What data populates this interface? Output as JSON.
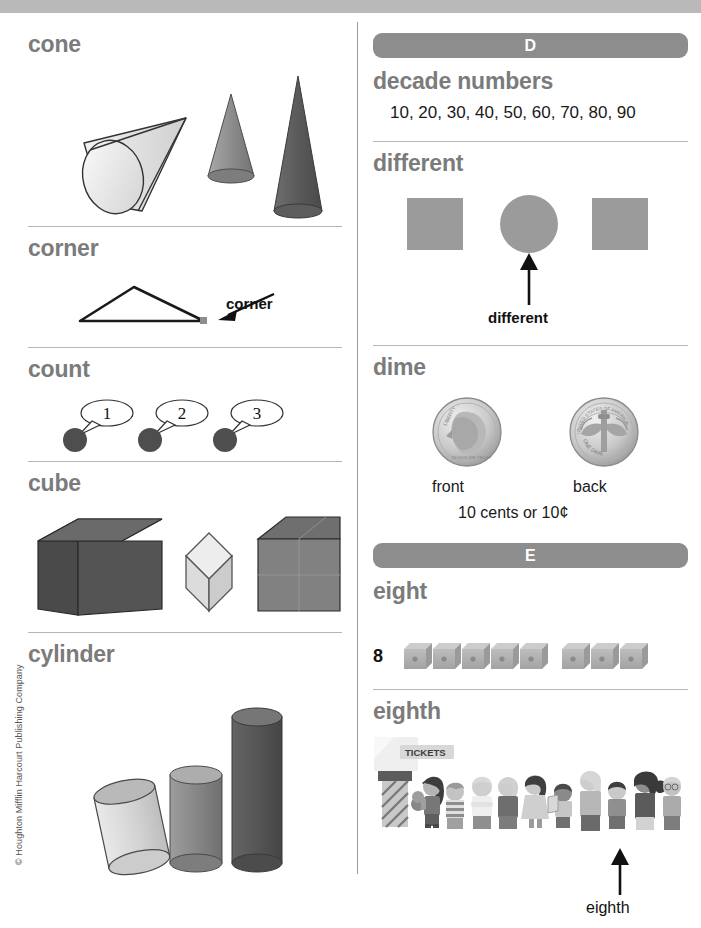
{
  "page": {
    "copyright": "© Houghton Mifflin Harcourt Publishing Company"
  },
  "left_column": {
    "entries": [
      {
        "term": "cone",
        "figure": "three-cones",
        "figure_parts": [
          "tilted light cone",
          "medium gray cone",
          "tall dark cone"
        ]
      },
      {
        "term": "corner",
        "figure": "triangle-with-corner-callout",
        "callout": "corner"
      },
      {
        "term": "count",
        "figure": "three-counters-with-speech-bubbles",
        "bubbles": [
          "1",
          "2",
          "3"
        ]
      },
      {
        "term": "cube",
        "figure": "three-cubes",
        "figure_parts": [
          "dark cube",
          "light tilted cube",
          "gray grid cube"
        ]
      },
      {
        "term": "cylinder",
        "figure": "three-cylinders",
        "figure_parts": [
          "short light tilted cylinder",
          "medium gray cylinder",
          "tall dark cylinder"
        ]
      }
    ]
  },
  "right_column": {
    "sections": [
      {
        "letter": "D",
        "entries": [
          {
            "term": "decade numbers",
            "value": "10, 20, 30, 40, 50, 60, 70, 80, 90"
          },
          {
            "term": "different",
            "figure": "square-circle-square",
            "callout": "different"
          },
          {
            "term": "dime",
            "figure": "dime-front-and-back",
            "front_label": "front",
            "back_label": "back",
            "value_text": "10 cents or 10¢",
            "coin_front_text": "LIBERTY",
            "coin_back_text_top": "UNITED STATES OF AMERICA",
            "coin_back_text_bottom": "ONE DIME"
          }
        ]
      },
      {
        "letter": "E",
        "entries": [
          {
            "term": "eight",
            "numeral": "8",
            "figure": "eight-cubes",
            "cube_count": 8,
            "cube_groups": [
              5,
              3
            ]
          },
          {
            "term": "eighth",
            "figure": "line-of-people-at-ticket-booth",
            "sign_text": "TICKETS",
            "callout": "eighth",
            "people_count": 10
          }
        ]
      }
    ]
  },
  "colors": {
    "band": "#b9b9b9",
    "term_gray": "#7b7b7b",
    "letter_bar": "#8d8d8d",
    "shape_gray": "#9b9b9b",
    "rule": "#b5b5b5",
    "dark_shape": "#5a5a5a",
    "mid_shape": "#8b8b8b",
    "light_shape": "#d6d6d6"
  }
}
